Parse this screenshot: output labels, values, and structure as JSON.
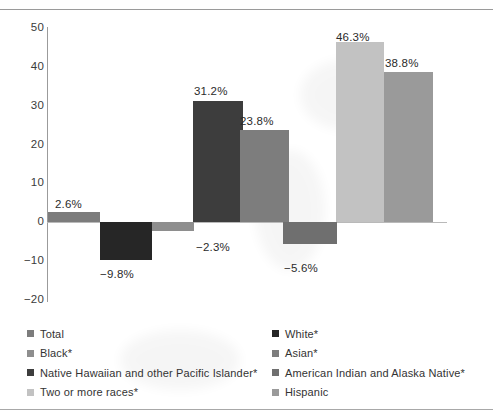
{
  "chart_data": {
    "type": "bar",
    "title": "",
    "xlabel": "",
    "ylabel": "",
    "ylim": [
      -20,
      50
    ],
    "ytick_labels": [
      "50",
      "40",
      "30",
      "20",
      "10",
      "0",
      "−10",
      "−20"
    ],
    "ytick_values": [
      50,
      40,
      30,
      20,
      10,
      0,
      -10,
      -20
    ],
    "grid": false,
    "legend_position": "bottom",
    "categories": [
      "Total",
      "White*",
      "Black*",
      "Native Hawaiian and other Pacific Islander*",
      "Asian*",
      "American Indian and Alaska Native*",
      "Two or more races*",
      "Hispanic"
    ],
    "values": [
      2.6,
      -9.8,
      -2.3,
      31.2,
      23.8,
      -5.6,
      46.3,
      38.8
    ],
    "data_labels": [
      "2.6%",
      "−9.8%",
      "−2.3%",
      "31.2%",
      "23.8%",
      "−5.6%",
      "46.3%",
      "38.8%"
    ],
    "colors": [
      "#7c7c7c",
      "#262626",
      "#8e8e8e",
      "#3d3d3d",
      "#7d7d7d",
      "#6f6f6f",
      "#c2c2c2",
      "#9a9a9a"
    ]
  },
  "legend": {
    "columns": [
      {
        "items": [
          {
            "label": "Total",
            "color": "#7c7c7c"
          },
          {
            "label": "Black*",
            "color": "#8e8e8e"
          },
          {
            "label": "Native Hawaiian and other Pacific Islander*",
            "color": "#3d3d3d"
          },
          {
            "label": "Two or more races*",
            "color": "#c2c2c2"
          }
        ]
      },
      {
        "items": [
          {
            "label": "White*",
            "color": "#262626"
          },
          {
            "label": "Asian*",
            "color": "#7d7d7d"
          },
          {
            "label": "American Indian and Alaska Native*",
            "color": "#6f6f6f"
          },
          {
            "label": "Hispanic",
            "color": "#9a9a9a"
          }
        ]
      }
    ]
  }
}
